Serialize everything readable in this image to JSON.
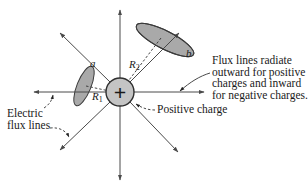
{
  "figure": {
    "charge": {
      "symbol": "+",
      "label": "Positive charge",
      "fill": "#c4c4c4",
      "stroke": "#333333"
    },
    "surfaces": [
      {
        "id": "a",
        "label": "a",
        "radius_label": "R",
        "radius_sub": "1",
        "fill": "#a9a9a9"
      },
      {
        "id": "b",
        "label": "b",
        "radius_label": "R",
        "radius_sub": "2",
        "fill": "#a9a9a9"
      }
    ],
    "annotations": {
      "flux_lines_label": [
        "Electric",
        "flux lines"
      ],
      "note": [
        "Flux lines radiate",
        "outward for positive",
        "charges and inward",
        "for negative charges."
      ]
    },
    "flux_line_count": 8,
    "colors": {
      "line": "#4a4a4a",
      "text": "#1a1a1a",
      "background": "#ffffff"
    }
  }
}
